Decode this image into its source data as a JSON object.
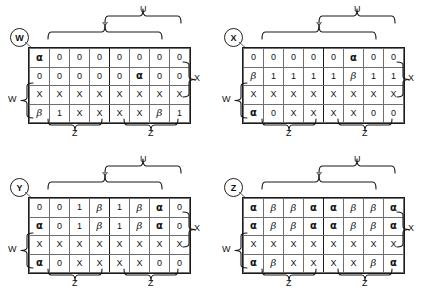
{
  "figure": {
    "map_count": 4,
    "rows": 4,
    "cols": 8,
    "colors": {
      "ink": "#111111",
      "frame": "#1a1a1a",
      "cell_border": "#6f6f6f",
      "background": "#ffffff"
    }
  },
  "labels": {
    "top_outer": "U",
    "top_inner": "Y",
    "bottom_left": "Z",
    "bottom_right": "Z",
    "left": "W",
    "right": "X"
  },
  "maps": [
    {
      "name": "W",
      "badge": "W",
      "cells": [
        [
          "α",
          "0",
          "0",
          "0",
          "0",
          "0",
          "0",
          "0"
        ],
        [
          "0",
          "0",
          "0",
          "0",
          "0",
          "α",
          "0",
          "0"
        ],
        [
          "X",
          "X",
          "X",
          "X",
          "X",
          "X",
          "X",
          "X"
        ],
        [
          "β",
          "1",
          "X",
          "X",
          "X",
          "X",
          "β",
          "1"
        ]
      ]
    },
    {
      "name": "X",
      "badge": "X",
      "cells": [
        [
          "0",
          "0",
          "0",
          "0",
          "0",
          "α",
          "0",
          "0"
        ],
        [
          "β",
          "1",
          "1",
          "1",
          "1",
          "β",
          "1",
          "1"
        ],
        [
          "X",
          "X",
          "X",
          "X",
          "X",
          "X",
          "X",
          "X"
        ],
        [
          "α",
          "0",
          "X",
          "X",
          "X",
          "X",
          "0",
          "0"
        ]
      ]
    },
    {
      "name": "Y",
      "badge": "Y",
      "cells": [
        [
          "0",
          "0",
          "1",
          "β",
          "1",
          "β",
          "α",
          "0"
        ],
        [
          "α",
          "0",
          "1",
          "β",
          "1",
          "β",
          "α",
          "0"
        ],
        [
          "X",
          "X",
          "X",
          "X",
          "X",
          "X",
          "X",
          "X"
        ],
        [
          "α",
          "0",
          "X",
          "X",
          "X",
          "X",
          "0",
          "0"
        ]
      ]
    },
    {
      "name": "Z",
      "badge": "Z",
      "cells": [
        [
          "α",
          "β",
          "β",
          "α",
          "α",
          "β",
          "β",
          "α"
        ],
        [
          "α",
          "β",
          "β",
          "α",
          "α",
          "β",
          "β",
          "α"
        ],
        [
          "X",
          "X",
          "X",
          "X",
          "X",
          "X",
          "X",
          "X"
        ],
        [
          "α",
          "β",
          "X",
          "X",
          "X",
          "X",
          "β",
          "α"
        ]
      ]
    }
  ]
}
